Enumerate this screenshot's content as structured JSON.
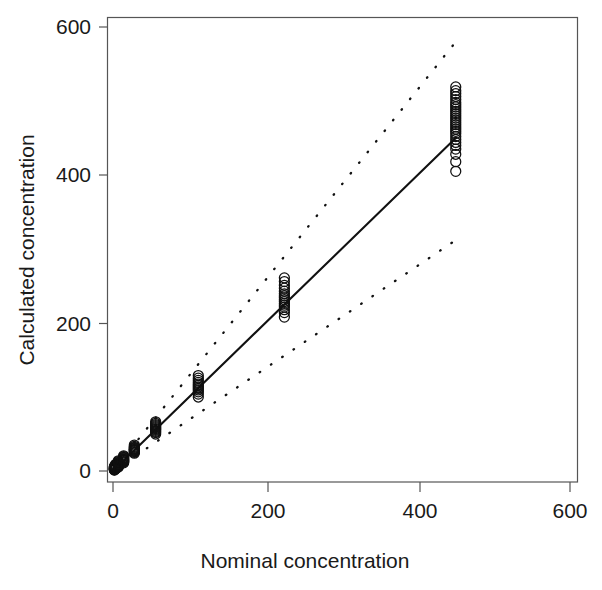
{
  "figure": {
    "background_color": "#ffffff",
    "foreground_color": "#1a1a1a",
    "marker_color": "#101010",
    "line_color": "#111111",
    "axis_color": "#555555"
  },
  "chart_data": {
    "type": "scatter",
    "title": "",
    "subtitle": "",
    "xlabel": "Nominal concentration",
    "ylabel": "Calculated concentration",
    "xlim": [
      -25,
      650
    ],
    "ylim": [
      -25,
      650
    ],
    "xticks": [
      0,
      200,
      400,
      600
    ],
    "yticks": [
      0,
      200,
      400,
      600
    ],
    "xtick_labels": [
      "0",
      "200",
      "400",
      "600"
    ],
    "ytick_labels": [
      "0",
      "200",
      "400",
      "600"
    ],
    "grid": false,
    "legend": null,
    "legend_position": "none",
    "marker": "open-circle",
    "marker_size": 5,
    "box_frame": true,
    "series": [
      {
        "name": "observations",
        "marker": "open-circle",
        "x": [
          1.8,
          1.8,
          1.8,
          1.8,
          1.8,
          1.8,
          1.8,
          1.8,
          1.8,
          1.8,
          1.8,
          1.8,
          3.5,
          3.5,
          3.5,
          3.5,
          3.5,
          3.5,
          3.5,
          3.5,
          3.5,
          3.5,
          3.5,
          3.5,
          7,
          7,
          7,
          7,
          7,
          7,
          7,
          7,
          7,
          7,
          7,
          7,
          14,
          14,
          14,
          14,
          14,
          14,
          14,
          14,
          14,
          14,
          14,
          14,
          28,
          28,
          28,
          28,
          28,
          28,
          28,
          28,
          28,
          28,
          28,
          28,
          56,
          56,
          56,
          56,
          56,
          56,
          56,
          56,
          56,
          56,
          56,
          56,
          112,
          112,
          112,
          112,
          112,
          112,
          112,
          112,
          112,
          112,
          112,
          112,
          225,
          225,
          225,
          225,
          225,
          225,
          225,
          225,
          225,
          225,
          225,
          225,
          225,
          225,
          225,
          225,
          450,
          450,
          450,
          450,
          450,
          450,
          450,
          450,
          450,
          450,
          450,
          450,
          450,
          450,
          450,
          450,
          450,
          450,
          450,
          450,
          450,
          450,
          450,
          450,
          450,
          450,
          450,
          450
        ],
        "y": [
          1.2,
          1.6,
          1.9,
          2.2,
          2.6,
          3.0,
          3.4,
          3.8,
          4.3,
          4.8,
          5.4,
          6.2,
          3.0,
          3.4,
          3.8,
          4.2,
          4.6,
          5.0,
          5.5,
          6.0,
          6.5,
          7.2,
          8.0,
          9.0,
          5.5,
          6.2,
          6.8,
          7.4,
          8.0,
          8.6,
          9.2,
          9.9,
          10.7,
          11.6,
          12.6,
          13.8,
          11.0,
          12.0,
          12.8,
          13.6,
          14.2,
          14.9,
          15.6,
          16.4,
          17.3,
          18.3,
          19.4,
          20.6,
          24.0,
          25.2,
          26.2,
          27.1,
          27.9,
          28.6,
          29.3,
          30.1,
          31.0,
          32.0,
          33.2,
          35.0,
          50.0,
          52.0,
          53.5,
          55.0,
          56.2,
          57.4,
          58.6,
          59.8,
          61.2,
          62.8,
          64.5,
          66.5,
          100.0,
          104.0,
          107.0,
          109.5,
          111.5,
          113.5,
          115.5,
          117.5,
          119.8,
          122.5,
          125.5,
          129.0,
          208.0,
          214.0,
          218.0,
          221.5,
          224.0,
          226.5,
          229.0,
          231.5,
          234.0,
          236.5,
          239.5,
          243.0,
          247.0,
          251.0,
          256.0,
          261.0,
          405.0,
          418.0,
          428.0,
          435.0,
          440.0,
          444.0,
          448.0,
          452.0,
          456.0,
          459.0,
          462.0,
          465.0,
          468.0,
          471.0,
          474.0,
          477.0,
          480.0,
          483.0,
          486.0,
          489.0,
          492.0,
          495.0,
          498.0,
          502.0,
          506.0,
          510.0,
          514.0,
          519.0
        ]
      }
    ],
    "lines": [
      {
        "name": "regression-fit",
        "style": "solid",
        "x": [
          0,
          450
        ],
        "y": [
          0,
          450
        ]
      },
      {
        "name": "upper-prediction-band",
        "style": "dotted",
        "x": [
          0,
          450
        ],
        "y": [
          0,
          580
        ]
      },
      {
        "name": "lower-prediction-band",
        "style": "dotted",
        "x": [
          0,
          450
        ],
        "y": [
          0,
          312
        ]
      }
    ]
  }
}
